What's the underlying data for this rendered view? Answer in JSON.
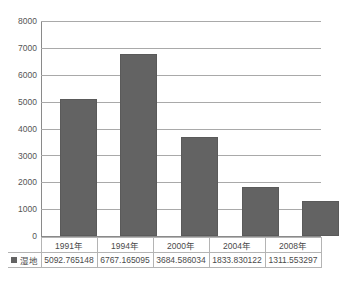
{
  "chart_data": {
    "type": "bar",
    "title": "",
    "xlabel": "",
    "ylabel": "",
    "categories": [
      "1991年",
      "1994年",
      "2000年",
      "2004年",
      "2008年"
    ],
    "series": [
      {
        "name": "湿地",
        "values": [
          5092.765148,
          6767.165095,
          3684.586034,
          1833.830122,
          1311.553297
        ],
        "value_labels": [
          "5092.765148",
          "6767.165095",
          "3684.586034",
          "1833.830122",
          "1311.553297"
        ],
        "color": "#636363"
      }
    ],
    "ylim": [
      0,
      8000
    ],
    "y_ticks": [
      0,
      1000,
      2000,
      3000,
      4000,
      5000,
      6000,
      7000,
      8000
    ],
    "y_tick_labels": [
      "0",
      "1000",
      "2000",
      "3000",
      "4000",
      "5000",
      "6000",
      "7000",
      "8000"
    ],
    "grid": true,
    "legend_position": "bottom-left",
    "has_data_table": true
  },
  "axis": {
    "t8000": "8000",
    "t7000": "7000",
    "t6000": "6000",
    "t5000": "5000",
    "t4000": "4000",
    "t3000": "3000",
    "t2000": "2000",
    "t1000": "1000",
    "t0": "0"
  },
  "table": {
    "years": [
      "1991年",
      "1994年",
      "2000年",
      "2004年",
      "2008年"
    ],
    "values": [
      "5092.765148",
      "6767.165095",
      "3684.586034",
      "1833.830122",
      "1311.553297"
    ],
    "legend_label": "湿地"
  }
}
